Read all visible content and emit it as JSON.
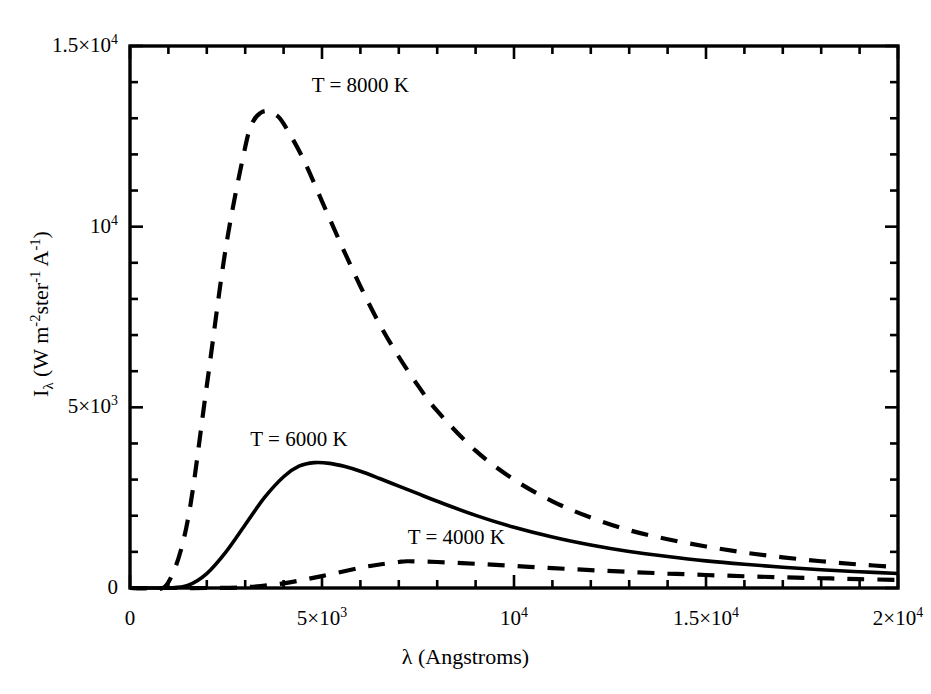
{
  "chart_data": {
    "type": "line",
    "title": "",
    "xlabel": "λ (Angstroms)",
    "ylabel": "Iλ (W m-2 ster-1 A-1)",
    "xlim": [
      0,
      20000
    ],
    "ylim": [
      0,
      15000
    ],
    "grid": false,
    "legend": "inline-annotations",
    "x_ticks": [
      {
        "value": 0,
        "label_mantissa": "0",
        "label_exp": ""
      },
      {
        "value": 5000,
        "label_mantissa": "5×10",
        "label_exp": "3"
      },
      {
        "value": 10000,
        "label_mantissa": "10",
        "label_exp": "4"
      },
      {
        "value": 15000,
        "label_mantissa": "1.5×10",
        "label_exp": "4"
      },
      {
        "value": 20000,
        "label_mantissa": "2×10",
        "label_exp": "4"
      }
    ],
    "y_ticks": [
      {
        "value": 0,
        "label_mantissa": "0",
        "label_exp": ""
      },
      {
        "value": 5000,
        "label_mantissa": "5×10",
        "label_exp": "3"
      },
      {
        "value": 10000,
        "label_mantissa": "10",
        "label_exp": "4"
      },
      {
        "value": 15000,
        "label_mantissa": "1.5×10",
        "label_exp": "4"
      }
    ],
    "x_minor_per_major": 5,
    "y_minor_per_major": 5,
    "series": [
      {
        "name": "T = 8000 K",
        "temperature_K": 8000,
        "style": "dashed",
        "color": "#000000",
        "label_x": 6000,
        "label_y": 13900,
        "peak_x": 3600,
        "peak_y": 13200,
        "x": [
          0,
          500,
          1000,
          1500,
          2000,
          2500,
          3000,
          3200,
          3400,
          3600,
          3800,
          4000,
          4500,
          5000,
          5500,
          6000,
          6500,
          7000,
          7500,
          8000,
          9000,
          10000,
          11000,
          12000,
          13000,
          14000,
          15000,
          16000,
          17000,
          18000,
          19000,
          20000
        ],
        "y": [
          0,
          2,
          160,
          1850,
          5600,
          9450,
          12200,
          12900,
          13150,
          13200,
          13100,
          12850,
          11900,
          10700,
          9500,
          8350,
          7300,
          6400,
          5600,
          4900,
          3800,
          3000,
          2400,
          1950,
          1600,
          1350,
          1150,
          980,
          850,
          740,
          650,
          580
        ]
      },
      {
        "name": "T = 6000 K",
        "temperature_K": 6000,
        "style": "solid",
        "color": "#000000",
        "label_x": 4400,
        "label_y": 4100,
        "peak_x": 4800,
        "peak_y": 3470,
        "x": [
          0,
          500,
          1000,
          1500,
          2000,
          2500,
          3000,
          3500,
          4000,
          4400,
          4800,
          5200,
          5600,
          6000,
          6500,
          7000,
          7500,
          8000,
          9000,
          10000,
          11000,
          12000,
          13000,
          14000,
          15000,
          16000,
          17000,
          18000,
          19000,
          20000
        ],
        "y": [
          0,
          0,
          2,
          70,
          400,
          1000,
          1750,
          2500,
          3080,
          3370,
          3470,
          3450,
          3360,
          3230,
          3030,
          2820,
          2610,
          2400,
          2010,
          1680,
          1410,
          1190,
          1010,
          870,
          750,
          655,
          575,
          505,
          450,
          400
        ]
      },
      {
        "name": "T = 4000 K",
        "temperature_K": 4000,
        "style": "dashed",
        "color": "#000000",
        "label_x": 8500,
        "label_y": 1380,
        "peak_x": 7200,
        "peak_y": 740,
        "x": [
          0,
          1000,
          2000,
          3000,
          4000,
          5000,
          6000,
          6500,
          7000,
          7200,
          7500,
          8000,
          9000,
          10000,
          11000,
          12000,
          13000,
          14000,
          15000,
          16000,
          17000,
          18000,
          19000,
          20000
        ],
        "y": [
          0,
          0,
          0,
          20,
          130,
          330,
          560,
          650,
          720,
          740,
          735,
          720,
          670,
          610,
          550,
          495,
          445,
          400,
          360,
          325,
          295,
          270,
          245,
          225
        ]
      }
    ]
  },
  "annotations": {
    "label_8000": "T = 8000 K",
    "label_6000": "T = 6000 K",
    "label_4000": "T = 4000 K"
  },
  "axes": {
    "x_title": "λ (Angstroms)",
    "y_title_prefix": "I",
    "y_title_sub": "λ",
    "y_title_rest": " (W m",
    "y_title_exp1": "-2",
    "y_title_mid": "ster",
    "y_title_exp2": "-1",
    "y_title_unit": " A",
    "y_title_exp3": "-1",
    "y_title_close": ")"
  },
  "colors": {
    "axis": "#000000",
    "curve": "#000000",
    "background": "#ffffff"
  }
}
